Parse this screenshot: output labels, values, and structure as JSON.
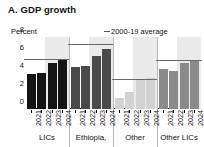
{
  "title": "A. GDP growth",
  "unit_label": "Percent",
  "legend": {
    "label": "2000-19 average",
    "dash_color": "#555555"
  },
  "axis": {
    "yticks": [
      "0",
      "2",
      "4",
      "6",
      "8"
    ]
  },
  "group_labels": [
    "LICs",
    "Ethiopia,",
    "Other",
    "Other LICs"
  ],
  "chart_data": {
    "type": "bar",
    "title": "A. GDP growth",
    "xlabel": "",
    "ylabel": "Percent",
    "ylim": [
      0,
      8
    ],
    "yticks": [
      0,
      2,
      4,
      6,
      8
    ],
    "grid": false,
    "legend_position": "top-right",
    "categories": [
      "2021",
      "2022",
      "2023",
      "2024"
    ],
    "groups": [
      {
        "name": "LICs",
        "color": "#141414",
        "values": [
          3.9,
          4.0,
          5.1,
          5.4
        ],
        "average_2000_19": 5.4,
        "forecast_years": [
          "2023",
          "2024"
        ]
      },
      {
        "name": "Ethiopia,",
        "color": "#4a4a4a",
        "values": [
          4.7,
          4.8,
          5.9,
          6.7
        ],
        "average_2000_19": 7.1,
        "forecast_years": [
          "2023",
          "2024"
        ]
      },
      {
        "name": "Other",
        "color": "#d2d2d2",
        "values": [
          1.2,
          1.9,
          3.3,
          3.4
        ],
        "average_2000_19": 3.2,
        "forecast_years": [
          "2023",
          "2024"
        ]
      },
      {
        "name": "Other LICs",
        "color": "#8a8a8a",
        "values": [
          4.5,
          4.2,
          5.1,
          5.5
        ],
        "average_2000_19": 5.3,
        "forecast_years": [
          "2023",
          "2024"
        ]
      }
    ],
    "annotations": [
      {
        "text": "2000-19 average",
        "type": "legend-line"
      }
    ]
  },
  "colors": {
    "forecast_band": "#eaeaea",
    "average_line": "#6a6a6a",
    "axis": "#000000"
  }
}
